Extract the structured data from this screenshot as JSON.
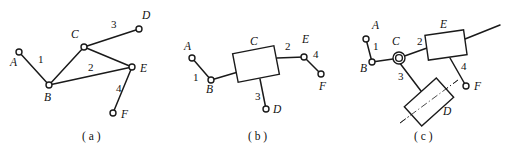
{
  "figure": {
    "width": 507,
    "height": 151,
    "background_color": "#ffffff",
    "line_color": "#1a1a1a"
  },
  "panels": [
    {
      "id": "a",
      "caption": "( a )",
      "caption_x": 82,
      "caption_y": 140,
      "description": "Open kinematic chain of revolute joints forming a closed triangle B-C-E",
      "joints": [
        {
          "label": "A",
          "cx": 19,
          "cy": 52,
          "r": 3.0,
          "label_x": 10,
          "label_y": 66,
          "type": "revolute"
        },
        {
          "label": "B",
          "cx": 49,
          "cy": 85,
          "r": 3.0,
          "label_x": 44,
          "label_y": 101,
          "type": "revolute"
        },
        {
          "label": "C",
          "cx": 84,
          "cy": 47,
          "r": 3.0,
          "label_x": 71,
          "label_y": 38,
          "type": "revolute"
        },
        {
          "label": "D",
          "cx": 139,
          "cy": 29,
          "r": 3.0,
          "label_x": 142,
          "label_y": 19,
          "type": "revolute"
        },
        {
          "label": "E",
          "cx": 132,
          "cy": 67,
          "r": 3.0,
          "label_x": 140,
          "label_y": 72,
          "type": "revolute"
        },
        {
          "label": "F",
          "cx": 113,
          "cy": 113,
          "r": 3.0,
          "label_x": 121,
          "label_y": 118,
          "type": "revolute"
        }
      ],
      "links": [
        {
          "number": "1",
          "from": "A",
          "to": "B",
          "x1": 19,
          "y1": 52,
          "x2": 49,
          "y2": 85,
          "label_x": 38,
          "label_y": 63
        },
        {
          "number": "2",
          "from": "B",
          "to": "C",
          "x1": 49,
          "y1": 85,
          "x2": 84,
          "y2": 47,
          "label_x": 88,
          "label_y": 71
        },
        {
          "number": "3",
          "from": "C",
          "to": "D",
          "x1": 84,
          "y1": 47,
          "x2": 139,
          "y2": 29,
          "label_x": 111,
          "label_y": 28
        },
        {
          "number": "4",
          "from": "E",
          "to": "F",
          "x1": 132,
          "y1": 67,
          "x2": 113,
          "y2": 113,
          "label_x": 116,
          "label_y": 92
        }
      ],
      "extra_links": [
        {
          "from": "B",
          "to": "E",
          "x1": 49,
          "y1": 85,
          "x2": 132,
          "y2": 67
        },
        {
          "from": "C",
          "to": "E",
          "x1": 84,
          "y1": 47,
          "x2": 132,
          "y2": 67
        }
      ]
    },
    {
      "id": "b",
      "caption": "( b )",
      "caption_x": 248,
      "caption_y": 140,
      "description": "Chain with rectangular ternary link C connecting members 1, 2 and 3",
      "joints": [
        {
          "label": "A",
          "cx": 192,
          "cy": 58,
          "r": 3.0,
          "label_x": 184,
          "label_y": 50,
          "type": "revolute"
        },
        {
          "label": "B",
          "cx": 211,
          "cy": 80,
          "r": 3.0,
          "label_x": 206,
          "label_y": 93,
          "type": "revolute"
        },
        {
          "label": "D",
          "cx": 266,
          "cy": 109,
          "r": 3.0,
          "label_x": 273,
          "label_y": 113,
          "type": "revolute"
        },
        {
          "label": "E",
          "cx": 304,
          "cy": 57,
          "r": 3.0,
          "label_x": 302,
          "label_y": 43,
          "type": "revolute"
        },
        {
          "label": "F",
          "cx": 321,
          "cy": 74,
          "r": 3.0,
          "label_x": 319,
          "label_y": 90,
          "type": "revolute"
        }
      ],
      "block": {
        "label": "C",
        "cx": 256,
        "cy": 64,
        "width": 42,
        "height": 29,
        "rotation": -11,
        "label_x": 250,
        "label_y": 45
      },
      "links": [
        {
          "number": "1",
          "from": "A",
          "to": "B",
          "x1": 192,
          "y1": 58,
          "x2": 211,
          "y2": 80,
          "label_x": 193,
          "label_y": 81
        },
        {
          "number": "2",
          "from": "C",
          "to": "E",
          "x1": 277,
          "y1": 58,
          "x2": 304,
          "y2": 57,
          "label_x": 285,
          "label_y": 50
        },
        {
          "number": "3",
          "from": "C",
          "to": "D",
          "x1": 260,
          "y1": 79,
          "x2": 266,
          "y2": 109,
          "label_x": 255,
          "label_y": 100
        },
        {
          "number": "4",
          "from": "E",
          "to": "F",
          "x1": 304,
          "y1": 57,
          "x2": 321,
          "y2": 74,
          "label_x": 313,
          "label_y": 58
        }
      ],
      "extra_links": [
        {
          "from": "B",
          "to": "C",
          "x1": 211,
          "y1": 80,
          "x2": 238,
          "y2": 72
        }
      ]
    },
    {
      "id": "c",
      "caption": "( c )",
      "caption_x": 414,
      "caption_y": 140,
      "description": "Chain with pin joint at C, sliding block D on an inclined guide, and block E",
      "joints": [
        {
          "label": "A",
          "cx": 366,
          "cy": 39,
          "r": 3.0,
          "label_x": 372,
          "label_y": 29,
          "type": "revolute"
        },
        {
          "label": "B",
          "cx": 372,
          "cy": 62,
          "r": 3.0,
          "label_x": 360,
          "label_y": 72,
          "type": "revolute"
        },
        {
          "label": "C",
          "cx": 399,
          "cy": 58,
          "r": 3.4,
          "label_x": 392,
          "label_y": 45,
          "type": "pin"
        },
        {
          "label": "F",
          "cx": 466,
          "cy": 86,
          "r": 3.0,
          "label_x": 474,
          "label_y": 90,
          "type": "revolute"
        }
      ],
      "pin_outer_r": 6.0,
      "block_e": {
        "label": "E",
        "cx": 446,
        "cy": 45,
        "width": 39,
        "height": 25,
        "rotation": -8,
        "label_x": 440,
        "label_y": 28
      },
      "slider_d": {
        "label": "D",
        "cx": 429,
        "cy": 102,
        "width": 43,
        "height": 26,
        "rotation": -42,
        "label_x": 443,
        "label_y": 115,
        "guide_x1": 400,
        "guide_y1": 123,
        "guide_x2": 458,
        "guide_y2": 80
      },
      "links": [
        {
          "number": "1",
          "from": "A",
          "to": "B",
          "x1": 366,
          "y1": 39,
          "x2": 372,
          "y2": 62,
          "label_x": 373,
          "label_y": 50
        },
        {
          "number": "2",
          "from": "C",
          "to": "E",
          "x1": 399,
          "y1": 58,
          "x2": 427,
          "y2": 48,
          "label_x": 417,
          "label_y": 45
        },
        {
          "number": "3",
          "from": "C",
          "to": "D",
          "x1": 399,
          "y1": 62,
          "x2": 421,
          "y2": 91,
          "label_x": 398,
          "label_y": 80
        },
        {
          "number": "4",
          "from": "E",
          "to": "F",
          "x1": 450,
          "y1": 58,
          "x2": 466,
          "y2": 86,
          "label_x": 461,
          "label_y": 70
        }
      ],
      "extra_links": [
        {
          "from": "B",
          "to": "C",
          "x1": 372,
          "y1": 62,
          "x2": 393,
          "y2": 59
        },
        {
          "from": "E",
          "to": "right-end",
          "x1": 465,
          "y1": 39,
          "x2": 500,
          "y2": 25
        }
      ]
    }
  ]
}
